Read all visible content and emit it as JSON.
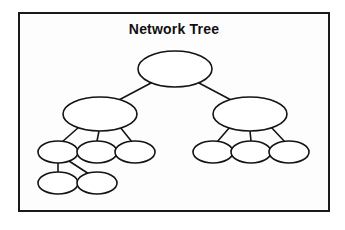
{
  "document": {
    "title": "Network Tree",
    "background_color": "#ffffff",
    "frame": {
      "border_color": "#1a1a1a",
      "fill_color": "#fdfdfd",
      "x": 18,
      "y": 12,
      "width": 312,
      "height": 200
    }
  },
  "diagram": {
    "type": "network-tree",
    "node_stroke_color": "#141414",
    "node_fill_color": "#ffffff",
    "edge_color": "#141414",
    "node_count": 11,
    "edge_count": 10,
    "levels": 4,
    "nodes": [
      {
        "id": "root",
        "label": "",
        "cx": 175,
        "cy": 69,
        "rx": 37,
        "ry": 18,
        "level": 0
      },
      {
        "id": "l1",
        "label": "",
        "cx": 100,
        "cy": 114,
        "rx": 37,
        "ry": 17,
        "level": 1
      },
      {
        "id": "r1",
        "label": "",
        "cx": 250,
        "cy": 114,
        "rx": 37,
        "ry": 17,
        "level": 1
      },
      {
        "id": "l1c1",
        "label": "",
        "cx": 58,
        "cy": 152,
        "rx": 20,
        "ry": 11,
        "level": 2
      },
      {
        "id": "l1c2",
        "label": "",
        "cx": 97,
        "cy": 152,
        "rx": 20,
        "ry": 11,
        "level": 2
      },
      {
        "id": "l1c3",
        "label": "",
        "cx": 135,
        "cy": 152,
        "rx": 20,
        "ry": 11,
        "level": 2
      },
      {
        "id": "r1c1",
        "label": "",
        "cx": 213,
        "cy": 152,
        "rx": 20,
        "ry": 11,
        "level": 2
      },
      {
        "id": "r1c2",
        "label": "",
        "cx": 251,
        "cy": 152,
        "rx": 20,
        "ry": 11,
        "level": 2
      },
      {
        "id": "r1c3",
        "label": "",
        "cx": 289,
        "cy": 152,
        "rx": 20,
        "ry": 11,
        "level": 2
      },
      {
        "id": "l1c1a",
        "label": "",
        "cx": 58,
        "cy": 183,
        "rx": 20,
        "ry": 11,
        "level": 3
      },
      {
        "id": "l1c1b",
        "label": "",
        "cx": 97,
        "cy": 183,
        "rx": 20,
        "ry": 11,
        "level": 3
      }
    ],
    "edges": [
      {
        "from": "root",
        "to": "l1",
        "x1": 151,
        "y1": 83,
        "x2": 117,
        "y2": 101
      },
      {
        "from": "root",
        "to": "r1",
        "x1": 199,
        "y1": 83,
        "x2": 233,
        "y2": 101
      },
      {
        "from": "l1",
        "to": "l1c1",
        "x1": 79,
        "y1": 127,
        "x2": 62,
        "y2": 142
      },
      {
        "from": "l1",
        "to": "l1c2",
        "x1": 99,
        "y1": 131,
        "x2": 97,
        "y2": 141
      },
      {
        "from": "l1",
        "to": "l1c3",
        "x1": 120,
        "y1": 127,
        "x2": 132,
        "y2": 142
      },
      {
        "from": "r1",
        "to": "r1c1",
        "x1": 230,
        "y1": 127,
        "x2": 217,
        "y2": 142
      },
      {
        "from": "r1",
        "to": "r1c2",
        "x1": 250,
        "y1": 131,
        "x2": 251,
        "y2": 141
      },
      {
        "from": "r1",
        "to": "r1c3",
        "x1": 271,
        "y1": 127,
        "x2": 285,
        "y2": 142
      },
      {
        "from": "l1c1",
        "to": "l1c1a",
        "x1": 58,
        "y1": 163,
        "x2": 58,
        "y2": 173
      },
      {
        "from": "l1c1",
        "to": "l1c1b",
        "x1": 69,
        "y1": 161,
        "x2": 89,
        "y2": 174
      }
    ]
  }
}
